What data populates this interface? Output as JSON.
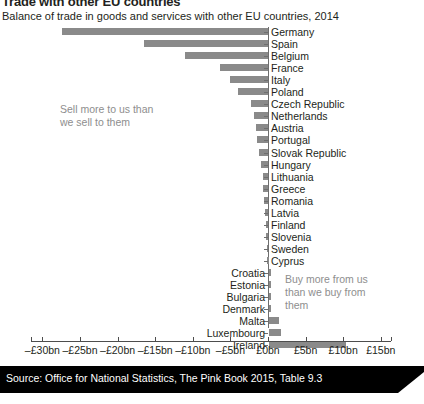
{
  "header": {
    "title": "Trade with other EU countries",
    "subtitle": "Balance of trade in goods and services with other EU countries, 2014"
  },
  "annotations": {
    "left": "Sell more to us than\nwe sell to them",
    "right": "Buy more from us\nthan we buy from\nthem"
  },
  "footer": {
    "source": "Source: Office for National Statistics, The Pink Book 2015, Table 9.3"
  },
  "chart_data": {
    "type": "bar",
    "orientation": "horizontal",
    "title": "Trade with other EU countries",
    "subtitle": "Balance of trade in goods and services with other EU countries, 2014",
    "xlabel": "",
    "ylabel": "",
    "xlim": [
      -32.5,
      17.0
    ],
    "grid": false,
    "legend": null,
    "bar_color": "#8a8a8a",
    "axis_color": "#4d4d4d",
    "unit": "£bn",
    "tick_values": [
      -30,
      -25,
      -20,
      -15,
      -10,
      -5,
      0,
      5,
      10,
      15
    ],
    "tick_labels": [
      "–£30bn",
      "–£25bn",
      "–£20bn",
      "–£15bn",
      "–£10bn",
      "–£5bn",
      "£0bn",
      "£5bn",
      "£10bn",
      "£15bn"
    ],
    "categories": [
      "Germany",
      "Spain",
      "Belgium",
      "France",
      "Italy",
      "Poland",
      "Czech Republic",
      "Netherlands",
      "Austria",
      "Portugal",
      "Slovak Republic",
      "Hungary",
      "Lithuania",
      "Greece",
      "Romania",
      "Latvia",
      "Finland",
      "Slovenia",
      "Sweden",
      "Cyprus",
      "Croatia",
      "Estonia",
      "Bulgaria",
      "Denmark",
      "Malta",
      "Luxembourg",
      "Ireland"
    ],
    "values": [
      -27.4,
      -16.5,
      -11.0,
      -6.4,
      -5.0,
      -4.0,
      -2.3,
      -1.9,
      -1.6,
      -1.4,
      -1.2,
      -0.9,
      -0.7,
      -0.6,
      -0.5,
      -0.4,
      -0.25,
      -0.2,
      -0.15,
      -0.1,
      0.05,
      0.1,
      0.15,
      0.25,
      1.3,
      1.6,
      10.2
    ]
  }
}
